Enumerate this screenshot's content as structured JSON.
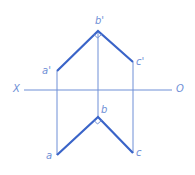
{
  "diagram": {
    "colors": {
      "thick": "#3a64c8",
      "thin": "#6f8fd6",
      "label": "#6f8fd6"
    },
    "axis": {
      "left_label": "X",
      "right_label": "O"
    },
    "front_view": {
      "a": "a'",
      "b": "b'",
      "c": "c'"
    },
    "top_view": {
      "a": "a",
      "b": "b",
      "c": "c"
    },
    "annotation": "right-angle marks at b' and b"
  }
}
